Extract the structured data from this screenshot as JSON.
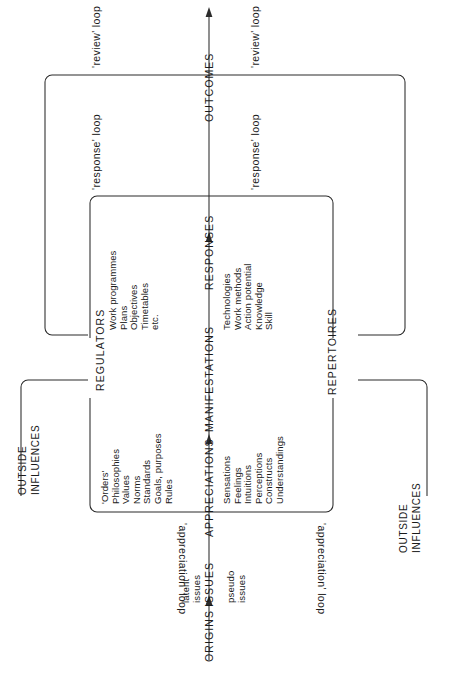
{
  "diagram": {
    "type": "systems-flow-diagram",
    "orientation": "rotated-90-landscape-on-portrait-page"
  },
  "axis": {
    "flow_labels": [
      {
        "id": "origins",
        "text": "ORIGINS"
      },
      {
        "id": "issues",
        "text": "ISSUES"
      },
      {
        "id": "appreciations",
        "text": "APPRECIATIONS"
      },
      {
        "id": "manifestations",
        "text": "MANIFESTATIONS"
      },
      {
        "id": "responses",
        "text": "RESPONSES"
      },
      {
        "id": "outcomes",
        "text": "OUTCOMES"
      }
    ]
  },
  "issue_types": {
    "latent": [
      "latent",
      "issues"
    ],
    "pseudo": [
      "pseudo",
      "issues"
    ]
  },
  "side_labels": {
    "regulators": "REGULATORS",
    "repertoires": "REPERTOIRES"
  },
  "loops": {
    "review_left": "'review' loop",
    "review_right": "'review' loop",
    "response_left": "'response' loop",
    "response_right": "'response' loop",
    "appreciation_left": "'appreciation' loop",
    "appreciation_right": "'appreciation' loop"
  },
  "outside_influences": {
    "left": [
      "OUTSIDE",
      "INFLUENCES"
    ],
    "right": [
      "OUTSIDE",
      "INFLUENCES"
    ]
  },
  "content_lists": {
    "regulator_appreciations": [
      "'Orders'",
      "Philosophies",
      "Values",
      "Norms",
      "Standards",
      "Goals, purposes",
      "Rules"
    ],
    "regulator_responses": [
      "Work programmes",
      "Plans",
      "Objectives",
      "Timetables",
      "etc."
    ],
    "repertoire_appreciations": [
      "Sensations",
      "Feelings",
      "Intuitions",
      "Perceptions",
      "Constructs",
      "Understandings"
    ],
    "repertoire_responses": [
      "Technologies",
      "Work methods",
      "Action potential",
      "Knowledge",
      "Skill"
    ]
  },
  "colors": {
    "ink": "#1a1a1a",
    "stroke": "#2b2b2b",
    "paper": "#ffffff"
  }
}
